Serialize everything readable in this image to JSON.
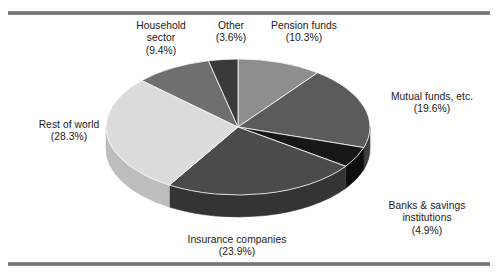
{
  "figure": {
    "title": "",
    "background_color": "#ffffff",
    "rule_color": "#6e6e6e"
  },
  "chart_data": {
    "type": "pie",
    "title": "",
    "xlabel": "",
    "ylabel": "",
    "legend_position": "none",
    "grid": false,
    "style": "3d-exploded-none",
    "start_angle_deg": 0,
    "direction": "clockwise",
    "categories": [
      "Pension funds",
      "Mutual funds, etc.",
      "Banks & savings institutions",
      "Insurance companies",
      "Rest of world",
      "Household sector",
      "Other"
    ],
    "values": [
      10.3,
      19.6,
      4.9,
      23.9,
      28.3,
      9.4,
      3.6
    ],
    "value_unit": "%",
    "slices": [
      {
        "name": "Pension funds",
        "value": 10.3,
        "percent_text": "(10.3%)",
        "label_lines": [
          "Pension funds",
          "(10.3%)"
        ],
        "color": "#8e8e8e",
        "side_color": "#6d6d6d"
      },
      {
        "name": "Mutual funds, etc.",
        "value": 19.6,
        "percent_text": "(19.6%)",
        "label_lines": [
          "Mutual funds, etc.",
          "(19.6%)"
        ],
        "color": "#5b5b5b",
        "side_color": "#3f3f3f"
      },
      {
        "name": "Banks & savings institutions",
        "value": 4.9,
        "percent_text": "(4.9%)",
        "label_lines": [
          "Banks & savings",
          "institutions",
          "(4.9%)"
        ],
        "color": "#171717",
        "side_color": "#0d0d0d"
      },
      {
        "name": "Insurance companies",
        "value": 23.9,
        "percent_text": "(23.9%)",
        "label_lines": [
          "Insurance companies",
          "(23.9%)"
        ],
        "color": "#4b4b4b",
        "side_color": "#343434"
      },
      {
        "name": "Rest of world",
        "value": 28.3,
        "percent_text": "(28.3%)",
        "label_lines": [
          "Rest of world",
          "(28.3%)"
        ],
        "color": "#dcdcdc",
        "side_color": "#bdbdbd"
      },
      {
        "name": "Household sector",
        "value": 9.4,
        "percent_text": "(9.4%)",
        "label_lines": [
          "Household",
          "sector",
          "(9.4%)"
        ],
        "color": "#6f6f6f",
        "side_color": "#525252"
      },
      {
        "name": "Other",
        "value": 3.6,
        "percent_text": "(3.6%)",
        "label_lines": [
          "Other",
          "(3.6%)"
        ],
        "color": "#3a3a3a",
        "side_color": "#282828"
      }
    ]
  },
  "labels": {
    "household": {
      "line1": "Household",
      "line2": "sector",
      "line3": "(9.4%)"
    },
    "other": {
      "line1": "Other",
      "line2": "(3.6%)"
    },
    "pension": {
      "line1": "Pension funds",
      "line2": "(10.3%)"
    },
    "mutual": {
      "line1": "Mutual funds, etc.",
      "line2": "(19.6%)"
    },
    "banks": {
      "line1": "Banks & savings",
      "line2": "institutions",
      "line3": "(4.9%)"
    },
    "insurance": {
      "line1": "Insurance companies",
      "line2": "(23.9%)"
    },
    "restofworld": {
      "line1": "Rest of world",
      "line2": "(28.3%)"
    }
  }
}
